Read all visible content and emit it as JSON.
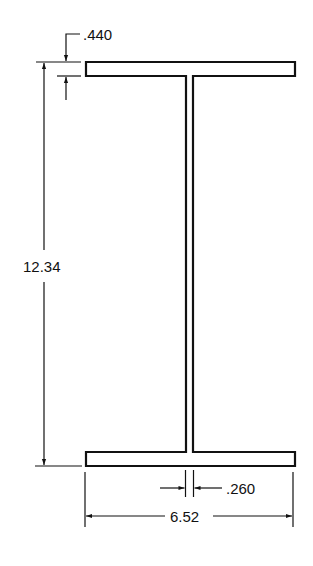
{
  "diagram": {
    "type": "I-beam cross-section",
    "colors": {
      "line": "#111111",
      "background": "#ffffff"
    },
    "dimensions": {
      "flange_thickness": ".440",
      "overall_depth": "12.34",
      "web_thickness": ".260",
      "flange_width": "6.52"
    }
  }
}
